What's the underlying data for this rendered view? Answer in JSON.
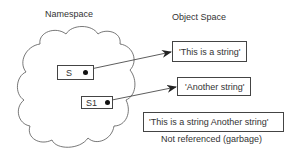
{
  "namespace": {
    "title": "Namespace",
    "variables": [
      {
        "name": "S"
      },
      {
        "name": "S1"
      }
    ]
  },
  "object_space": {
    "title": "Object Space",
    "objects": [
      {
        "value": "'This is a string'"
      },
      {
        "value": "'Another string'"
      },
      {
        "value": "'This is a string  Another string'",
        "caption": "Not referenced (garbage)"
      }
    ]
  }
}
